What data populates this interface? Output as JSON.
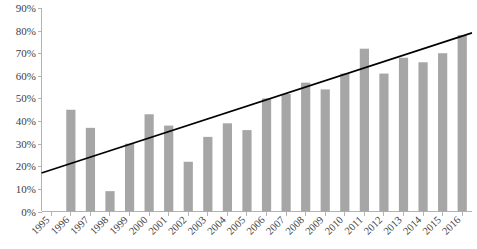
{
  "chart_data": {
    "type": "bar",
    "title": "",
    "subtitle": "",
    "xlabel": "",
    "ylabel": "",
    "ylim": [
      0,
      90
    ],
    "ytick_labels": [
      "0%",
      "10%",
      "20%",
      "30%",
      "40%",
      "50%",
      "60%",
      "70%",
      "80%",
      "90%"
    ],
    "ytick_values": [
      0,
      10,
      20,
      30,
      40,
      50,
      60,
      70,
      80,
      90
    ],
    "grid": false,
    "legend": "none",
    "categories": [
      "1995",
      "1996",
      "1997",
      "1998",
      "1999",
      "2000",
      "2001",
      "2002",
      "2003",
      "2004",
      "2005",
      "2006",
      "2007",
      "2008",
      "2009",
      "2010",
      "2011",
      "2012",
      "2013",
      "2014",
      "2015",
      "2016"
    ],
    "values": [
      0,
      45,
      37,
      9,
      30,
      43,
      38,
      22,
      33,
      39,
      36,
      50,
      52,
      57,
      54,
      61,
      72,
      61,
      68,
      66,
      70,
      78
    ],
    "series": [
      {
        "name": "Percentage",
        "type": "bar",
        "color": "#a6a6a6",
        "values": [
          0,
          45,
          37,
          9,
          30,
          43,
          38,
          22,
          33,
          39,
          36,
          50,
          52,
          57,
          54,
          61,
          72,
          61,
          68,
          66,
          70,
          78
        ]
      },
      {
        "name": "Linear trend",
        "type": "line",
        "color": "#000000",
        "start_value": 17,
        "end_value": 79
      }
    ],
    "annotations": []
  },
  "colors": {
    "bar": "#a6a6a6",
    "trendline": "#000000",
    "axis": "#b3b3b3",
    "label": "#404040",
    "background": "#ffffff"
  }
}
